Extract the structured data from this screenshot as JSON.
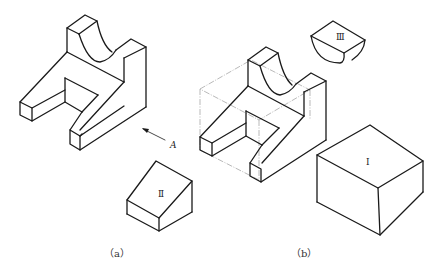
{
  "figure": {
    "captions": {
      "a": "（a）",
      "b": "（b）"
    },
    "labels": {
      "view_direction": "A",
      "part_1": "Ⅰ",
      "part_2": "Ⅱ",
      "part_3": "Ⅲ"
    },
    "colors": {
      "line": "#1a1a1a",
      "construction": "#8a8a8a",
      "background": "#ffffff"
    }
  }
}
